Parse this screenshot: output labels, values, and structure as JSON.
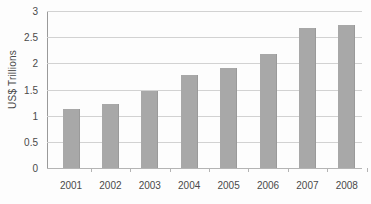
{
  "chart_data": {
    "type": "bar",
    "title": "",
    "subtitle": "",
    "xlabel": "",
    "ylabel": "US$ Trillions",
    "categories": [
      "2001",
      "2002",
      "2003",
      "2004",
      "2005",
      "2006",
      "2007",
      "2008"
    ],
    "values": [
      1.12,
      1.22,
      1.48,
      1.77,
      1.91,
      2.18,
      2.67,
      2.74
    ],
    "series": [
      {
        "name": "US$ Trillions",
        "values": [
          1.12,
          1.22,
          1.48,
          1.77,
          1.91,
          2.18,
          2.67,
          2.74
        ]
      }
    ],
    "ylim": [
      0,
      3
    ],
    "yticks": [
      "0",
      "0.5",
      "1",
      "1.5",
      "2",
      "2.5",
      "3"
    ],
    "ytick_values": [
      0,
      0.5,
      1,
      1.5,
      2,
      2.5,
      3
    ],
    "grid": true,
    "legend": false,
    "legend_position": "none",
    "bar_color": "#a8a8a8",
    "gridline_color": "#d2d2d2",
    "axis_color": "#9a9a9a",
    "background_color": "#fdfdfd",
    "text_color": "#4a4a4a"
  }
}
